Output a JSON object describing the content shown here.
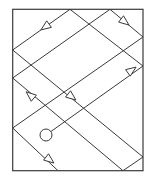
{
  "diagram": {
    "stroke_color": "#3a3a3a",
    "background": "#ffffff",
    "box": {
      "x": 12.7,
      "y": 9.3,
      "width": 130.3,
      "height": 161.4
    },
    "segments": [
      {
        "id": "s1",
        "from": [
          70,
          9.3
        ],
        "to": [
          12.7,
          50
        ]
      },
      {
        "id": "s2",
        "from": [
          12.7,
          50
        ],
        "to": [
          143,
          157
        ]
      },
      {
        "id": "s3",
        "from": [
          70,
          9.3
        ],
        "to": [
          143,
          66
        ]
      },
      {
        "id": "s4",
        "from": [
          110,
          9.3
        ],
        "to": [
          12.7,
          78
        ]
      },
      {
        "id": "s5",
        "from": [
          110,
          9.3
        ],
        "to": [
          143,
          37
        ]
      },
      {
        "id": "s6",
        "from": [
          143,
          37
        ],
        "to": [
          12.7,
          128
        ]
      },
      {
        "id": "s7",
        "from": [
          12.7,
          78
        ],
        "to": [
          123,
          170.7
        ]
      },
      {
        "id": "s8",
        "from": [
          46,
          135
        ],
        "to": [
          143,
          66
        ]
      },
      {
        "id": "s9",
        "from": [
          12.7,
          128
        ],
        "to": [
          58,
          170.7
        ]
      },
      {
        "id": "s10",
        "from": [
          143,
          157
        ],
        "to": [
          123,
          170.7
        ]
      }
    ],
    "arrows": [
      {
        "id": "a1",
        "at": [
          45,
          27
        ],
        "direction": "down-left"
      },
      {
        "id": "a2",
        "at": [
          125,
          22
        ],
        "direction": "down-right"
      },
      {
        "id": "a3",
        "at": [
          132,
          70
        ],
        "direction": "up-right"
      },
      {
        "id": "a4",
        "at": [
          30,
          95
        ],
        "direction": "up-left"
      },
      {
        "id": "a5",
        "at": [
          72,
          97
        ],
        "direction": "down-right"
      },
      {
        "id": "a6",
        "at": [
          50,
          160
        ],
        "direction": "down-right"
      }
    ],
    "source": {
      "shape": "circle",
      "cx": 46,
      "cy": 135,
      "r": 6
    }
  }
}
